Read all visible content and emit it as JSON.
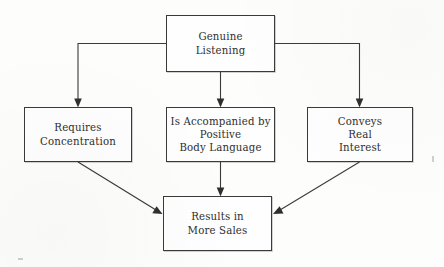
{
  "diagram": {
    "type": "flowchart",
    "title_node": "Genuine Listening",
    "background_color": "#fdfdfc",
    "line_color": "#3b3b3b",
    "text_color": "#2e2e2e",
    "nodes": [
      {
        "id": "genuine-listening",
        "lines": [
          "Genuine",
          "Listening"
        ],
        "x": 166,
        "y": 15,
        "w": 109,
        "h": 57
      },
      {
        "id": "requires-concentration",
        "lines": [
          "Requires",
          "Concentration"
        ],
        "x": 24,
        "y": 107,
        "w": 108,
        "h": 55
      },
      {
        "id": "positive-body-language",
        "lines": [
          "Is Accompanied by",
          "Positive",
          "Body Language"
        ],
        "x": 166,
        "y": 107,
        "w": 109,
        "h": 55
      },
      {
        "id": "conveys-real-interest",
        "lines": [
          "Conveys",
          "Real",
          "Interest"
        ],
        "x": 307,
        "y": 107,
        "w": 106,
        "h": 55
      },
      {
        "id": "results-in-more-sales",
        "lines": [
          "Results in",
          "More Sales"
        ],
        "x": 163,
        "y": 196,
        "w": 109,
        "h": 55
      }
    ],
    "edges": [
      {
        "id": "edge-listening-to-concentration",
        "from": "genuine-listening",
        "to": "requires-concentration",
        "style": "orthogonal-left",
        "arrow": true
      },
      {
        "id": "edge-listening-to-body-language",
        "from": "genuine-listening",
        "to": "positive-body-language",
        "style": "vertical",
        "arrow": true
      },
      {
        "id": "edge-listening-to-interest",
        "from": "genuine-listening",
        "to": "conveys-real-interest",
        "style": "orthogonal-right",
        "arrow": true
      },
      {
        "id": "edge-concentration-to-sales",
        "from": "requires-concentration",
        "to": "results-in-more-sales",
        "style": "diagonal",
        "arrow": true
      },
      {
        "id": "edge-body-language-to-sales",
        "from": "positive-body-language",
        "to": "results-in-more-sales",
        "style": "vertical",
        "arrow": true
      },
      {
        "id": "edge-interest-to-sales",
        "from": "conveys-real-interest",
        "to": "results-in-more-sales",
        "style": "diagonal",
        "arrow": true
      }
    ]
  }
}
